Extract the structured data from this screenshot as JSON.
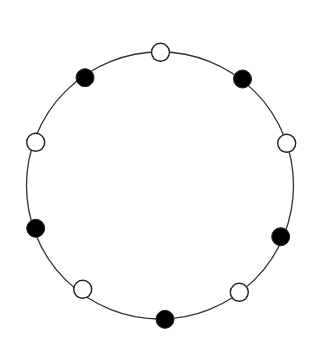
{
  "diagram": {
    "type": "necklace",
    "circle": {
      "cx": 160,
      "cy": 185.5,
      "r": 133.5,
      "stroke": "#333333",
      "stroke_width": 1.3
    },
    "bead_radius": 9,
    "colors": {
      "black": "#000000",
      "white": "#ffffff",
      "outline": "#222222"
    },
    "beads": [
      {
        "id": "top",
        "color": "white",
        "x": 160.5,
        "y": 52.3
      },
      {
        "id": "top-right",
        "color": "black",
        "x": 242.5,
        "y": 79
      },
      {
        "id": "right",
        "color": "white",
        "x": 286.7,
        "y": 143.3
      },
      {
        "id": "lower-right",
        "color": "black",
        "x": 280.7,
        "y": 236.7
      },
      {
        "id": "bottom-right",
        "color": "white",
        "x": 239.3,
        "y": 292.3
      },
      {
        "id": "bottom",
        "color": "black",
        "x": 165,
        "y": 319.3
      },
      {
        "id": "bottom-left",
        "color": "white",
        "x": 82.7,
        "y": 289.3
      },
      {
        "id": "lower-left",
        "color": "black",
        "x": 35.7,
        "y": 228.3
      },
      {
        "id": "left",
        "color": "white",
        "x": 35.7,
        "y": 142.3
      },
      {
        "id": "top-left",
        "color": "black",
        "x": 85,
        "y": 77.7
      }
    ],
    "counts": {
      "white": 5,
      "black": 5,
      "total": 10
    }
  }
}
